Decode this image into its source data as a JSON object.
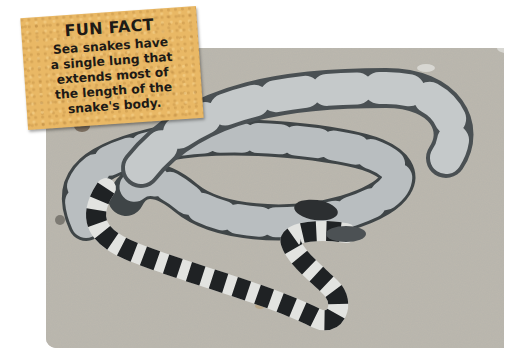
{
  "fun_fact": {
    "title": "FUN FACT",
    "lines": [
      "Sea snakes have",
      "a single lung that",
      "extends most of",
      "the length of the",
      "snake's body."
    ]
  },
  "photo": {
    "subject": "banded sea snake on sand",
    "colors": {
      "sand": "#b9b5ab",
      "snake_light": "#c9ccca",
      "snake_dark": "#26292b",
      "note_background": "#e9b865"
    }
  }
}
